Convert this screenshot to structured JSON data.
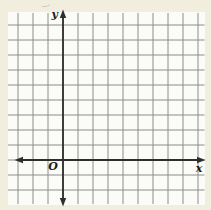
{
  "figure": {
    "origin_label": "O",
    "x_axis_label": "x",
    "y_axis_label": "y",
    "grid_columns": 12,
    "grid_rows": 11,
    "y_axis_at_column": 3,
    "x_axis_at_row": 9,
    "colors": {
      "page_background": "#f2eedd",
      "paper": "#fbfbf8",
      "grid_line": "#8c8c8c",
      "axis": "#2e2e2e",
      "label_text": "#1c1c1c"
    }
  }
}
